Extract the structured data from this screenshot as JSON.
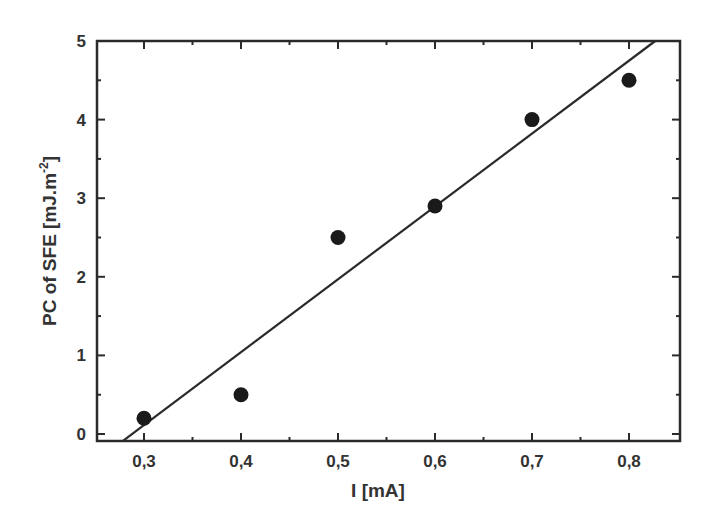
{
  "chart_data": {
    "type": "scatter",
    "title": "",
    "xlabel": "I [mA]",
    "ylabel": "PC of SFE [mJ.m",
    "ylabel_superscript": "-2",
    "ylabel_suffix": "]",
    "xlim": [
      0.253,
      0.853
    ],
    "ylim": [
      -0.09,
      5.0
    ],
    "x_ticks": [
      0.3,
      0.4,
      0.5,
      0.6,
      0.7,
      0.8
    ],
    "x_tick_labels": [
      "0,3",
      "0,4",
      "0,5",
      "0,6",
      "0,7",
      "0,8"
    ],
    "x_minor_ticks": [
      0.35,
      0.45,
      0.55,
      0.65,
      0.75
    ],
    "y_ticks": [
      0,
      1,
      2,
      3,
      4,
      5
    ],
    "y_tick_labels": [
      "0",
      "1",
      "2",
      "3",
      "4",
      "5"
    ],
    "y_minor_ticks": [
      0.5,
      1.5,
      2.5,
      3.5,
      4.5
    ],
    "grid": false,
    "legend": null,
    "series": [
      {
        "name": "measured",
        "type": "scatter",
        "marker": "filled-circle",
        "color": "#1a1a1a",
        "x": [
          0.3,
          0.4,
          0.5,
          0.6,
          0.7,
          0.8
        ],
        "y": [
          0.2,
          0.5,
          2.5,
          2.9,
          4.0,
          4.5
        ]
      },
      {
        "name": "linear fit",
        "type": "line",
        "color": "#2a2a2a",
        "x": [
          0.278,
          0.827
        ],
        "y": [
          -0.09,
          5.0
        ]
      }
    ]
  }
}
